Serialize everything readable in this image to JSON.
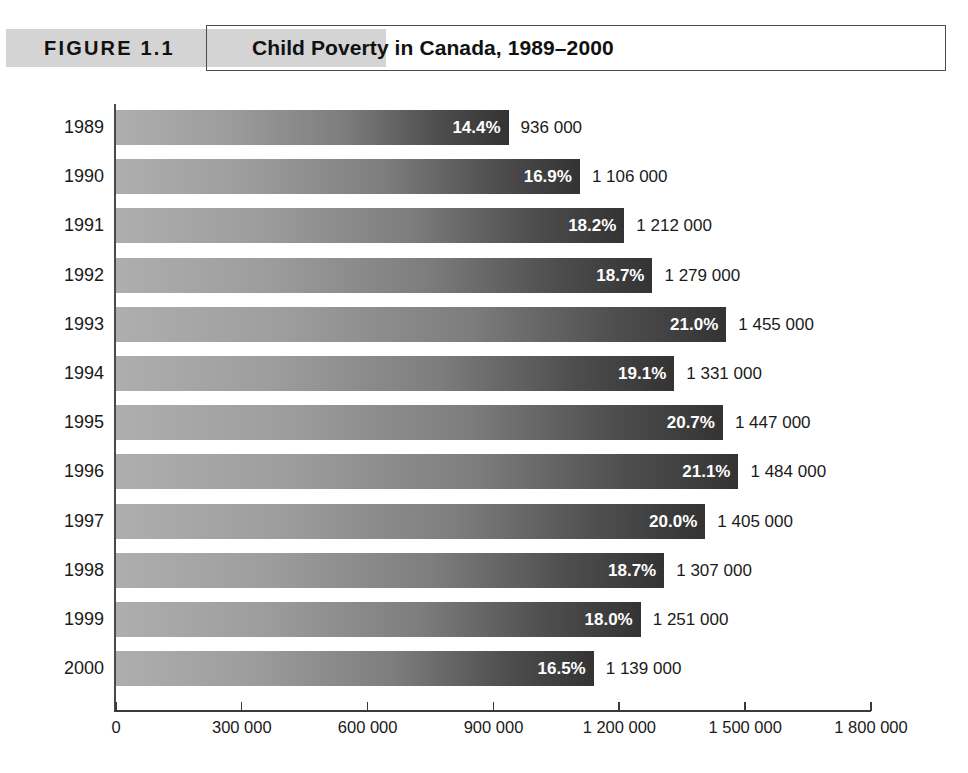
{
  "figure": {
    "number_label": "FIGURE 1.1",
    "title": "Child Poverty in Canada, 1989–2000"
  },
  "chart_data": {
    "type": "bar",
    "orientation": "horizontal",
    "title": "Child Poverty in Canada, 1989–2000",
    "xlabel": "",
    "ylabel": "",
    "categories": [
      "1989",
      "1990",
      "1991",
      "1992",
      "1993",
      "1994",
      "1995",
      "1996",
      "1997",
      "1998",
      "1999",
      "2000"
    ],
    "values": [
      936000,
      1106000,
      1212000,
      1279000,
      1455000,
      1331000,
      1447000,
      1484000,
      1405000,
      1307000,
      1251000,
      1139000
    ],
    "value_labels": [
      "936 000",
      "1 106 000",
      "1 212 000",
      "1 279 000",
      "1 455 000",
      "1 331 000",
      "1 447 000",
      "1 484 000",
      "1 405 000",
      "1 307 000",
      "1 251 000",
      "1 139 000"
    ],
    "percent_values": [
      14.4,
      16.9,
      18.2,
      18.7,
      21.0,
      19.1,
      20.7,
      21.1,
      20.0,
      18.7,
      18.0,
      16.5
    ],
    "percent_labels": [
      "14.4%",
      "16.9%",
      "18.2%",
      "18.7%",
      "21.0%",
      "19.1%",
      "20.7%",
      "21.1%",
      "20.0%",
      "18.7%",
      "18.0%",
      "16.5%"
    ],
    "xlim": [
      0,
      1800000
    ],
    "xticks": [
      0,
      300000,
      600000,
      900000,
      1200000,
      1500000,
      1800000
    ],
    "xtick_labels": [
      "0",
      "300 000",
      "600 000",
      "900 000",
      "1 200 000",
      "1 500 000",
      "1 800 000"
    ],
    "grid": false,
    "legend": null,
    "bar_gradient_from": "#aeaeae",
    "bar_gradient_to": "#333333",
    "axis_color": "#3a3a3a",
    "band_color": "#d4d4d4"
  }
}
